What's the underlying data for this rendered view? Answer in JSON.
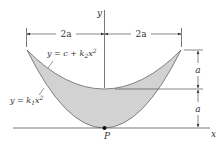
{
  "diagram": {
    "axes": {
      "x_label": "x",
      "y_label": "y"
    },
    "point": {
      "label": "P"
    },
    "dimensions": {
      "left_width": "2a",
      "right_width": "2a",
      "upper_height": "a",
      "lower_height": "a"
    },
    "curves": {
      "upper": {
        "label_lhs": "y = c + k",
        "sub": "2",
        "var": "x",
        "sup": "2"
      },
      "lower": {
        "label_lhs": "y = k",
        "sub": "1",
        "var": "x",
        "sup": "2"
      }
    },
    "colors": {
      "fill": "#cfcfcf",
      "line": "#555555",
      "background": "#ffffff"
    }
  }
}
